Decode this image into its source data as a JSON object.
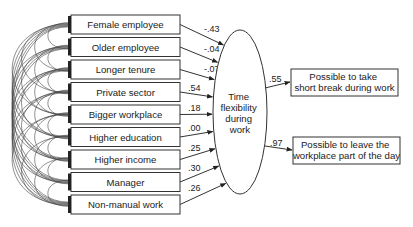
{
  "diagram": {
    "type": "structural-equation-model",
    "predictors": [
      {
        "label": "Female employee",
        "coefficient": "-.43"
      },
      {
        "label": "Older employee",
        "coefficient": "-.04"
      },
      {
        "label": "Longer tenure",
        "coefficient": "-.07"
      },
      {
        "label": "Private sector",
        "coefficient": ".54"
      },
      {
        "label": "Bigger workplace",
        "coefficient": ".18"
      },
      {
        "label": "Higher education",
        "coefficient": ".00"
      },
      {
        "label": "Higher income",
        "coefficient": ".25"
      },
      {
        "label": "Manager",
        "coefficient": ".30"
      },
      {
        "label": "Non-manual work",
        "coefficient": ".26"
      }
    ],
    "latent": {
      "lines": [
        "Time",
        "flexibility",
        "during",
        "work"
      ]
    },
    "outcomes": [
      {
        "lines": [
          "Possible to take",
          "short break during work"
        ],
        "loading": ".55"
      },
      {
        "lines": [
          "Possible to leave the",
          "workplace part of the day"
        ],
        "loading": ".97"
      }
    ],
    "colors": {
      "stroke": "#333333",
      "text": "#222222",
      "background": "#ffffff"
    }
  }
}
